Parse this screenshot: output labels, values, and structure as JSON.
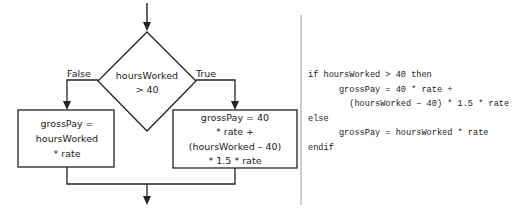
{
  "flowchart": {
    "decision": {
      "line1": "hoursWorked",
      "line2": "> 40"
    },
    "false_label": "False",
    "true_label": "True",
    "false_box": {
      "lines": [
        "grossPay =",
        "hoursWorked",
        "* rate"
      ]
    },
    "true_box": {
      "lines": [
        "grossPay = 40",
        "* rate +",
        "(hoursWorked – 40)",
        "* 1.5 * rate"
      ]
    }
  },
  "pseudocode": {
    "lines": [
      "if hoursWorked > 40 then",
      "      grossPay = 40 * rate +",
      "        (hoursWorked – 40) * 1.5 * rate",
      "else",
      "      grossPay = hoursWorked * rate",
      "endif"
    ]
  },
  "colors": {
    "stroke": "#222222",
    "divider": "#9a9a9a",
    "text": "#222222"
  }
}
